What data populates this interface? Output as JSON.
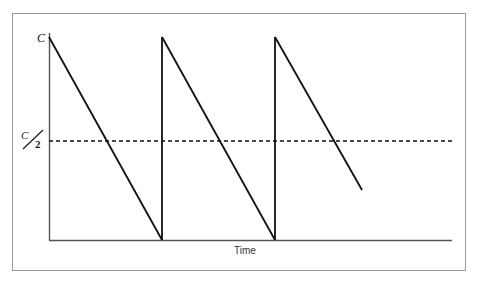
{
  "figure": {
    "background_color": "#ffffff",
    "border_color": "#999999",
    "line_color": "#111111",
    "axis_color": "#555555",
    "dashed_color": "#111111",
    "border": {
      "x": 12,
      "y": 13,
      "width": 453,
      "height": 257
    }
  },
  "labels": {
    "y_top": "C",
    "y_half_numerator": "C",
    "y_half_denominator": "2",
    "y_half": "C/2",
    "x_axis": "Time"
  },
  "chart_data": {
    "type": "line",
    "title": "",
    "xlabel": "Time",
    "ylabel": "",
    "grid": false,
    "legend": null,
    "axis": {
      "y_axis_x": 49,
      "y_axis_top": 33,
      "baseline_y": 240,
      "x_axis_start": 49,
      "x_axis_end": 452
    },
    "ylim": [
      0,
      1
    ],
    "ytick_values": [
      0.5,
      1
    ],
    "ytick_labels": [
      "C/2",
      "C"
    ],
    "annotations": [
      {
        "text": "C",
        "x": 49,
        "y": 37,
        "role": "peak-value-label"
      },
      {
        "text": "C/2",
        "x": 49,
        "y": 141,
        "role": "half-value-label"
      }
    ],
    "threshold_line": {
      "label": "C/2",
      "style": "dashed",
      "y_pixel": 141,
      "y_value": 0.5,
      "x_start": 49,
      "x_end": 452,
      "dash_on": 4,
      "dash_off": 3
    },
    "series": [
      {
        "name": "sawtooth",
        "style": "solid",
        "points_pixel": [
          [
            49,
            37
          ],
          [
            162,
            240
          ],
          [
            162,
            37
          ],
          [
            275,
            240
          ],
          [
            275,
            37
          ],
          [
            362,
            190
          ]
        ],
        "ramps": [
          {
            "peak_x": 49,
            "peak_y": 37,
            "end_x": 162,
            "end_y": 240,
            "complete": true
          },
          {
            "peak_x": 162,
            "peak_y": 37,
            "end_x": 275,
            "end_y": 240,
            "complete": true
          },
          {
            "peak_x": 275,
            "peak_y": 37,
            "end_x": 362,
            "end_y": 190,
            "complete": false
          }
        ],
        "period_pixels": 113,
        "crossings_half": [
          112,
          225,
          338
        ]
      }
    ]
  }
}
